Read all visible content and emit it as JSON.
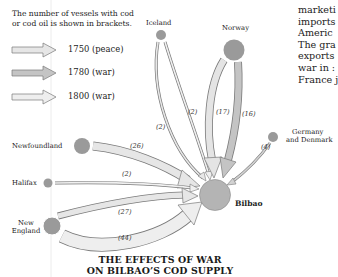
{
  "note": {
    "line1": "The number of vessels with cod",
    "line2": "or cod oil is shown in brackets."
  },
  "legend": [
    {
      "label": "1750 (peace)",
      "fill": "#e4e4e4"
    },
    {
      "label": "1780 (war)",
      "fill": "#c2c2c2"
    },
    {
      "label": "1800 (war)",
      "fill": "#ececec"
    }
  ],
  "places": {
    "iceland": "Iceland",
    "norway": "Norway",
    "germany_line1": "Germany",
    "germany_line2": "and Denmark",
    "newfoundland": "Newfoundland",
    "halifax": "Halifax",
    "new_england_line1": "New",
    "new_england_line2": "England",
    "bilbao": "Bilbao"
  },
  "flows": [
    {
      "from": "Iceland",
      "period": "1750 (peace)",
      "vessels": "(2)"
    },
    {
      "from": "Iceland",
      "period": "1800 (war)",
      "vessels": "(2)"
    },
    {
      "from": "Norway",
      "period": "1750 (peace)",
      "vessels": "(17)"
    },
    {
      "from": "Norway",
      "period": "1780 (war)",
      "vessels": "(16)"
    },
    {
      "from": "Germany and Denmark",
      "period": "1780 (war)",
      "vessels": "(4)"
    },
    {
      "from": "Newfoundland",
      "period": "1750 (peace)",
      "vessels": "(26)"
    },
    {
      "from": "Halifax",
      "period": "1800 (war)",
      "vessels": "(2)"
    },
    {
      "from": "New England",
      "period": "1750 (peace)",
      "vessels": "(27)"
    },
    {
      "from": "New England",
      "period": "1800 (war)",
      "vessels": "(44)"
    }
  ],
  "title": {
    "line1": "THE EFFECTS OF WAR",
    "line2": "ON BILBAO’S COD SUPPLY"
  },
  "side_text": [
    "marketi",
    "imports",
    "Americ",
    "The gra",
    "exports",
    "war in :",
    "France j"
  ],
  "colors": {
    "node": "#9a9a9a",
    "bilbao": "#b4b4b4",
    "arrow_stroke": "#7a7a7a"
  }
}
